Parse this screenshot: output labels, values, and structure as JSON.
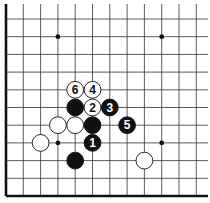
{
  "diagram": {
    "type": "go-board-fragment",
    "visible_columns": 12,
    "visible_rows": 11,
    "edges": {
      "left": true,
      "bottom": true,
      "top": false,
      "right": false
    },
    "colors": {
      "line": "#333333",
      "edge": "#111111",
      "black_stone": "#111111",
      "white_stone": "#ffffff",
      "star": "#111111"
    },
    "star_points": [
      {
        "col": 3,
        "row": 1
      },
      {
        "col": 9,
        "row": 1
      },
      {
        "col": 3,
        "row": 7
      },
      {
        "col": 9,
        "row": 7
      }
    ],
    "stones": [
      {
        "col": 4,
        "row": 4,
        "color": "white",
        "label": "6"
      },
      {
        "col": 5,
        "row": 4,
        "color": "white",
        "label": "4"
      },
      {
        "col": 4,
        "row": 5,
        "color": "black",
        "label": ""
      },
      {
        "col": 5,
        "row": 5,
        "color": "white",
        "label": "2"
      },
      {
        "col": 6,
        "row": 5,
        "color": "black",
        "label": "3"
      },
      {
        "col": 3,
        "row": 6,
        "color": "white",
        "label": ""
      },
      {
        "col": 4,
        "row": 6,
        "color": "white",
        "label": ""
      },
      {
        "col": 5,
        "row": 6,
        "color": "black",
        "label": ""
      },
      {
        "col": 7,
        "row": 6,
        "color": "black",
        "label": "5"
      },
      {
        "col": 2,
        "row": 7,
        "color": "white",
        "label": ""
      },
      {
        "col": 5,
        "row": 7,
        "color": "black",
        "label": "1"
      },
      {
        "col": 4,
        "row": 8,
        "color": "black",
        "label": ""
      },
      {
        "col": 8,
        "row": 8,
        "color": "white",
        "label": ""
      }
    ]
  }
}
